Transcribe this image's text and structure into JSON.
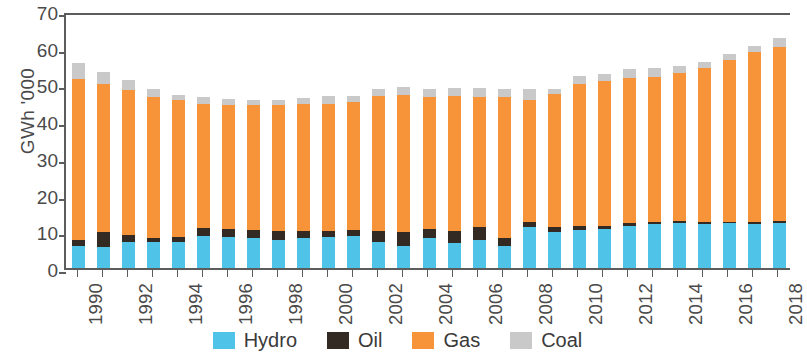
{
  "chart_data": {
    "type": "bar",
    "stacked": true,
    "title": "",
    "subtitle": "",
    "xlabel": "",
    "ylabel": "GWh '000",
    "ylim": [
      0,
      70
    ],
    "ytick_step": 10,
    "yticks": [
      0,
      10,
      20,
      30,
      40,
      50,
      60,
      70
    ],
    "grid": false,
    "legend_position": "bottom",
    "categories": [
      "1990",
      "1991",
      "1992",
      "1993",
      "1994",
      "1995",
      "1996",
      "1997",
      "1998",
      "1999",
      "2000",
      "2001",
      "2002",
      "2003",
      "2004",
      "2005",
      "2006",
      "2007",
      "2008",
      "2009",
      "2010",
      "2011",
      "2012",
      "2013",
      "2014",
      "2015",
      "2016",
      "2017",
      "2018"
    ],
    "xtick_labels": [
      "1990",
      "1992",
      "1994",
      "1996",
      "1998",
      "2000",
      "2002",
      "2004",
      "2006",
      "2008",
      "2010",
      "2012",
      "2014",
      "2016",
      "2018"
    ],
    "series": [
      {
        "name": "Hydro",
        "color": "#4FC3E8",
        "values": [
          6.5,
          6.2,
          7.5,
          7.7,
          7.5,
          9.2,
          9.0,
          8.6,
          8.3,
          8.6,
          9.0,
          9.3,
          7.5,
          6.6,
          8.8,
          7.3,
          8.3,
          6.5,
          11.7,
          10.3,
          10.9,
          11.2,
          12.1,
          12.4,
          12.8,
          12.6,
          12.8,
          12.6,
          12.9
        ]
      },
      {
        "name": "Oil",
        "color": "#332A24",
        "values": [
          1.6,
          4.2,
          2.1,
          1.1,
          1.4,
          2.3,
          2.1,
          2.3,
          2.2,
          2.1,
          1.5,
          1.6,
          3.0,
          3.8,
          2.4,
          3.4,
          3.3,
          2.1,
          1.3,
          1.5,
          1.0,
          0.8,
          0.7,
          0.6,
          0.5,
          0.5,
          0.4,
          0.4,
          0.4
        ]
      },
      {
        "name": "Gas",
        "color": "#F79338",
        "values": [
          44.0,
          40.3,
          39.5,
          38.2,
          37.5,
          33.8,
          33.8,
          34.0,
          34.4,
          34.5,
          34.7,
          34.9,
          36.8,
          37.2,
          36.0,
          36.6,
          35.6,
          38.5,
          33.4,
          36.2,
          38.8,
          39.4,
          39.4,
          39.7,
          40.5,
          42.0,
          44.0,
          46.3,
          47.5
        ]
      },
      {
        "name": "Coal",
        "color": "#C9C9C9",
        "values": [
          4.2,
          3.3,
          2.6,
          2.2,
          1.4,
          1.7,
          1.8,
          1.4,
          1.4,
          1.6,
          2.1,
          1.6,
          2.0,
          2.3,
          2.2,
          2.2,
          2.3,
          2.1,
          2.9,
          1.4,
          2.2,
          2.0,
          2.6,
          2.4,
          1.8,
          1.5,
          1.6,
          1.6,
          2.4
        ]
      }
    ]
  },
  "legend": {
    "items": [
      {
        "label": "Hydro",
        "color": "#4FC3E8"
      },
      {
        "label": "Oil",
        "color": "#332A24"
      },
      {
        "label": "Gas",
        "color": "#F79338"
      },
      {
        "label": "Coal",
        "color": "#C9C9C9"
      }
    ]
  }
}
